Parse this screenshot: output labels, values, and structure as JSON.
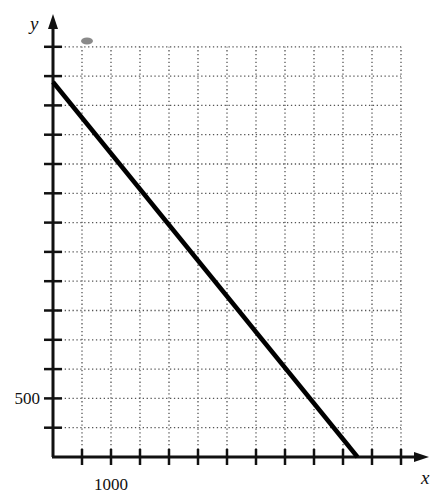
{
  "chart_data": {
    "type": "line",
    "title": "",
    "xlabel": "x",
    "ylabel": "y",
    "xlim": [
      0,
      6000
    ],
    "ylim": [
      0,
      3500
    ],
    "x_tick_step": 500,
    "y_tick_step": 250,
    "x_tick_labels": [
      {
        "value": 1000,
        "label": "1000"
      }
    ],
    "y_tick_labels": [
      {
        "value": 500,
        "label": "500"
      }
    ],
    "grid": true,
    "grid_style": "dotted",
    "legend": null,
    "series": [
      {
        "name": "line",
        "points": [
          [
            0,
            3200
          ],
          [
            5250,
            0
          ]
        ],
        "color": "#000000"
      }
    ]
  },
  "colors": {
    "axis": "#111111",
    "grid": "#555555",
    "line": "#000000",
    "smudge": "#8a8a8a"
  }
}
